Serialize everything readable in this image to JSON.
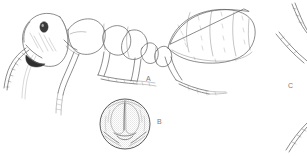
{
  "plate": {
    "background_color": "#ffffff",
    "ink_color": "#5c5c5c",
    "dark_ink_color": "#2e2e2e",
    "label_color": "#7a7a7a",
    "width": 307,
    "height": 156
  },
  "figures": [
    {
      "key": "A",
      "label": "A",
      "caption": "A",
      "subject": "ant worker, lateral habitus",
      "label_x": 146,
      "label_y": 75,
      "parts": [
        "head",
        "compound eye",
        "mandible",
        "antennal scape",
        "antennal funiculus",
        "pronotum",
        "mesonotum",
        "propodeum",
        "petiole",
        "postpetiole",
        "gaster",
        "fore leg",
        "mid leg",
        "hind leg"
      ]
    },
    {
      "key": "B",
      "label": "B",
      "caption": "B",
      "subject": "head capsule, full-face view",
      "label_x": 157,
      "label_y": 118,
      "parts": [
        "frontal carina",
        "clypeus",
        "mandible",
        "occipital margin",
        "stippled sculpture"
      ]
    },
    {
      "key": "C",
      "label": "C",
      "caption": "C",
      "subject": "detail figure, partially cropped at right margin",
      "label_x": 288,
      "label_y": 82,
      "parts": [
        "curved appendage outline",
        "curved appendage outline"
      ]
    }
  ]
}
